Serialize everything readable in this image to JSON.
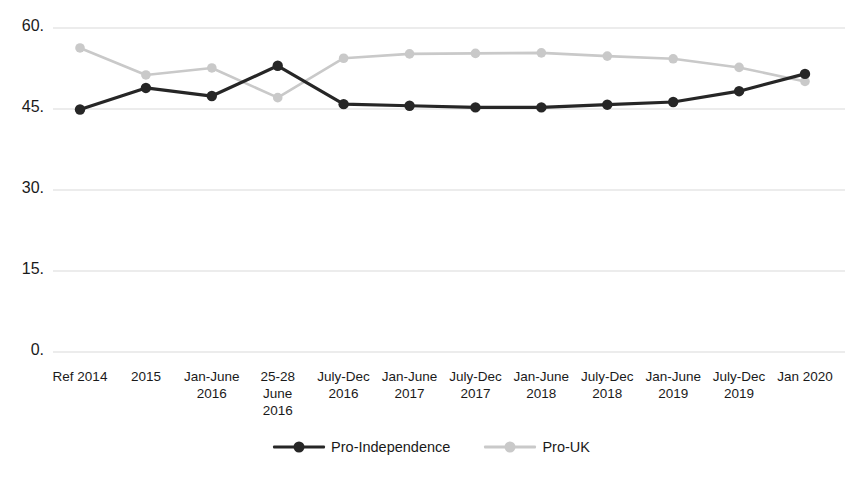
{
  "chart_data": {
    "type": "line",
    "title": "",
    "xlabel": "",
    "ylabel": "",
    "ylim": [
      0,
      60
    ],
    "yticks": [
      0,
      15,
      30,
      45,
      60
    ],
    "ytick_labels": [
      "0.",
      "15.",
      "30.",
      "45.",
      "60."
    ],
    "grid": true,
    "legend_position": "bottom",
    "categories": [
      "Ref 2014",
      "2015",
      "Jan-June\n2016",
      "25-28\nJune\n2016",
      "July-Dec\n2016",
      "Jan-June\n2017",
      "July-Dec\n2017",
      "Jan-June\n2018",
      "July-Dec\n2018",
      "Jan-June\n2019",
      "July-Dec\n2019",
      "Jan 2020"
    ],
    "series": [
      {
        "name": "Pro-Independence",
        "color": "#262626",
        "values": [
          44.9,
          48.9,
          47.4,
          53.0,
          45.9,
          45.6,
          45.3,
          45.3,
          45.8,
          46.3,
          48.3,
          51.5
        ]
      },
      {
        "name": "Pro-UK",
        "color": "#c9c9c9",
        "values": [
          56.3,
          51.3,
          52.6,
          47.1,
          54.4,
          55.2,
          55.3,
          55.4,
          54.8,
          54.3,
          52.7,
          50.1
        ]
      }
    ]
  },
  "legend": {
    "items": [
      {
        "label": "Pro-Independence",
        "color": "#262626"
      },
      {
        "label": "Pro-UK",
        "color": "#c9c9c9"
      }
    ]
  },
  "colors": {
    "grid": "#d9d9d9",
    "text": "#1a1a1a",
    "background": "#ffffff",
    "pro_independence": "#262626",
    "pro_uk": "#c9c9c9"
  }
}
